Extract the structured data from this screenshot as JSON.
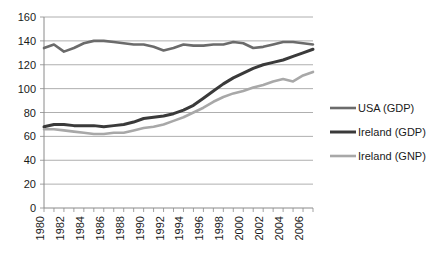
{
  "chart_data": {
    "type": "line",
    "title": "",
    "subtitle": "",
    "xlabel": "",
    "ylabel": "",
    "ylim": [
      0,
      160
    ],
    "xlim": [
      1980,
      2007
    ],
    "y_ticks": [
      0,
      20,
      40,
      60,
      80,
      100,
      120,
      140,
      160
    ],
    "x_ticks_major": [
      1980,
      1982,
      1984,
      1986,
      1988,
      1990,
      1992,
      1994,
      1996,
      1998,
      2000,
      2002,
      2004,
      2006
    ],
    "x_tick_labels": [
      "1980",
      "1982",
      "1984",
      "1986",
      "1988",
      "1990",
      "1992",
      "1994",
      "1996",
      "1998",
      "2000",
      "2002",
      "2004",
      "2006"
    ],
    "x": [
      1980,
      1981,
      1982,
      1983,
      1984,
      1985,
      1986,
      1987,
      1988,
      1989,
      1990,
      1991,
      1992,
      1993,
      1994,
      1995,
      1996,
      1997,
      1998,
      1999,
      2000,
      2001,
      2002,
      2003,
      2004,
      2005,
      2006,
      2007
    ],
    "grid": true,
    "legend_position": "right",
    "series": [
      {
        "name": "USA (GDP)",
        "color": "#6b6b6b",
        "width": 2.6,
        "values": [
          134,
          137,
          131,
          134,
          138,
          140,
          140,
          139,
          138,
          137,
          137,
          135,
          132,
          134,
          137,
          136,
          136,
          137,
          137,
          139,
          138,
          134,
          135,
          137,
          139,
          139,
          138,
          137
        ]
      },
      {
        "name": "Ireland (GDP)",
        "color": "#3a3a3a",
        "width": 3.0,
        "values": [
          68,
          70,
          70,
          69,
          69,
          69,
          68,
          69,
          70,
          72,
          75,
          76,
          77,
          79,
          82,
          86,
          92,
          98,
          104,
          109,
          113,
          117,
          120,
          122,
          124,
          127,
          130,
          133
        ]
      },
      {
        "name": "Ireland (GNP)",
        "color": "#a8a8a8",
        "width": 2.6,
        "values": [
          66,
          66,
          65,
          64,
          63,
          62,
          62,
          63,
          63,
          65,
          67,
          68,
          70,
          73,
          76,
          80,
          84,
          89,
          93,
          96,
          98,
          101,
          103,
          106,
          108,
          106,
          111,
          114
        ]
      }
    ]
  },
  "legend": {
    "entries": [
      {
        "label": "USA (GDP)"
      },
      {
        "label": "Ireland (GDP)"
      },
      {
        "label": "Ireland (GNP)"
      }
    ]
  }
}
